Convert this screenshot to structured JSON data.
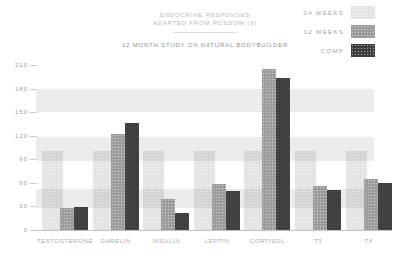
{
  "chart_data": {
    "type": "bar",
    "title": "ENDOCRINE RESPONSES",
    "subtitle": "ADAPTED FROM ROSSOW (9)",
    "caption": "12 MONTH STUDY ON NATURAL BODYBUILDER",
    "categories": [
      "TESTOSTERONE",
      "GHRELIN",
      "INSULIN",
      "LEPTIN",
      "CORTISOL",
      "T3",
      "T4"
    ],
    "series": [
      {
        "name": "24 WEEKS",
        "color": "#e4e4e4",
        "values": [
          100,
          100,
          100,
          100,
          100,
          100,
          100
        ]
      },
      {
        "name": "12 WEEKS",
        "color": "#9c9c9c",
        "values": [
          27,
          122,
          39,
          58,
          205,
          56,
          64
        ]
      },
      {
        "name": "COMP",
        "color": "#3f3f3f",
        "values": [
          29,
          136,
          21,
          49,
          193,
          51,
          60
        ]
      }
    ],
    "ylim": [
      0,
      210
    ],
    "yticks": [
      210,
      180,
      150,
      120,
      90,
      60,
      30,
      0
    ],
    "highlight_bands": [
      [
        150,
        180
      ],
      [
        88,
        118
      ],
      [
        28,
        52
      ]
    ],
    "legend_position": "top-right",
    "grid": false,
    "axis_color": "#c4c4c4",
    "label_color": "#a9a9a9"
  }
}
